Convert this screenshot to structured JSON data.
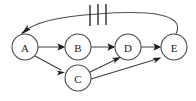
{
  "diagram": {
    "type": "directed-graph",
    "title": "",
    "background_color": "#ffffff",
    "node_fill": "#ffffff",
    "node_stroke": "#4a4a4a",
    "edge_color": "#3d3d3d",
    "arrow_color": "#1f1f1f",
    "tick_color": "#2b2b2b",
    "nodes": [
      {
        "id": "A",
        "label": "A",
        "cx": 25,
        "cy": 47,
        "r": 13
      },
      {
        "id": "B",
        "label": "B",
        "cx": 78,
        "cy": 47,
        "r": 13
      },
      {
        "id": "C",
        "label": "C",
        "cx": 78,
        "cy": 78,
        "r": 13
      },
      {
        "id": "D",
        "label": "D",
        "cx": 128,
        "cy": 47,
        "r": 13
      },
      {
        "id": "E",
        "label": "E",
        "cx": 174,
        "cy": 47,
        "r": 13
      }
    ],
    "edges": [
      {
        "from": "A",
        "to": "B",
        "style": "straight",
        "directed": true
      },
      {
        "from": "B",
        "to": "D",
        "style": "straight",
        "directed": true
      },
      {
        "from": "D",
        "to": "E",
        "style": "straight",
        "directed": true
      },
      {
        "from": "A",
        "to": "C",
        "style": "straight",
        "directed": true
      },
      {
        "from": "C",
        "to": "D",
        "style": "straight",
        "directed": true
      },
      {
        "from": "C",
        "to": "E",
        "style": "straight",
        "directed": true
      },
      {
        "from": "E",
        "to": "A",
        "style": "arc-over-top",
        "directed": true,
        "tick_count": 3
      }
    ],
    "tick_marks": {
      "count": 3,
      "positions_x": [
        90,
        98,
        106
      ],
      "top_y": 5,
      "bottom_y": 26,
      "description": "three vertical slash marks crossing the E-to-A feedback arc"
    }
  }
}
